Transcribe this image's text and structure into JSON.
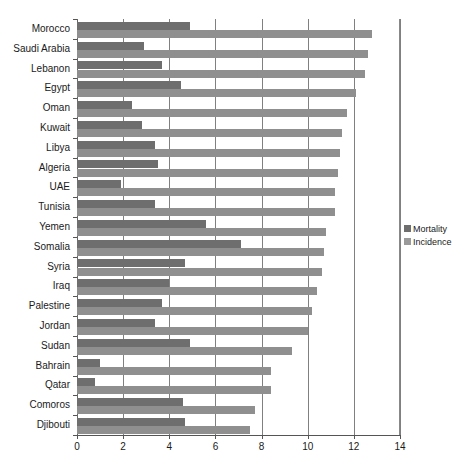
{
  "chart_data": {
    "type": "bar",
    "orientation": "horizontal",
    "title": "",
    "subtitle": "",
    "xlabel": "",
    "ylabel": "",
    "xlim": [
      0,
      14
    ],
    "ylim": null,
    "grid": true,
    "grid_axis": "x",
    "xticks": [
      0,
      2,
      4,
      6,
      8,
      10,
      12,
      14
    ],
    "xtick_labels": [
      "0",
      "2",
      "4",
      "6",
      "8",
      "10",
      "12",
      "14"
    ],
    "legend": {
      "position": "right",
      "entries": [
        {
          "name": "Mortality",
          "color": "#6e6e6e"
        },
        {
          "name": "Incidence",
          "color": "#9a9a9a"
        }
      ]
    },
    "categories": [
      "Morocco",
      "Saudi Arabia",
      "Lebanon",
      "Egypt",
      "Oman",
      "Kuwait",
      "Libya",
      "Algeria",
      "UAE",
      "Tunisia",
      "Yemen",
      "Somalia",
      "Syria",
      "Iraq",
      "Palestine",
      "Jordan",
      "Sudan",
      "Bahrain",
      "Qatar",
      "Comoros",
      "Djibouti"
    ],
    "series": [
      {
        "name": "Mortality",
        "color": "#6e6e6e",
        "values": [
          4.9,
          2.9,
          3.7,
          4.5,
          2.4,
          2.8,
          3.4,
          3.5,
          1.9,
          3.4,
          5.6,
          7.1,
          4.7,
          4.0,
          3.7,
          3.4,
          4.9,
          1.0,
          0.8,
          4.6,
          4.7
        ]
      },
      {
        "name": "Incidence",
        "color": "#9a9a9a",
        "values": [
          12.8,
          12.6,
          12.5,
          12.1,
          11.7,
          11.5,
          11.4,
          11.3,
          11.2,
          11.2,
          10.8,
          10.7,
          10.6,
          10.4,
          10.2,
          10.0,
          9.3,
          8.4,
          8.4,
          7.7,
          7.5
        ]
      }
    ]
  }
}
